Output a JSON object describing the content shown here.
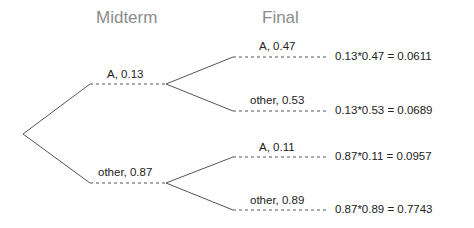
{
  "headers": {
    "midterm": "Midterm",
    "final": "Final"
  },
  "midterm": [
    {
      "label": "A,  0.13",
      "outcome": "A",
      "prob": 0.13
    },
    {
      "label": "other,  0.87",
      "outcome": "other",
      "prob": 0.87
    }
  ],
  "final": [
    {
      "label": "A,  0.47",
      "result": "0.13*0.47  =  0.0611"
    },
    {
      "label": "other,  0.53",
      "result": "0.13*0.53  =  0.0689"
    },
    {
      "label": "A,  0.11",
      "result": "0.87*0.11  =  0.0957"
    },
    {
      "label": "other,  0.89",
      "result": "0.87*0.89  =  0.7743"
    }
  ],
  "colors": {
    "line": "#555555",
    "header": "#8c8c8c",
    "text": "#222222"
  }
}
